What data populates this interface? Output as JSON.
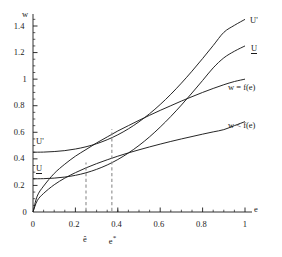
{
  "chart_data": {
    "type": "line",
    "title": "",
    "xlabel": "e",
    "ylabel": "w",
    "xlim": [
      0,
      1.06
    ],
    "ylim": [
      0,
      1.52
    ],
    "grid": false,
    "legend_position": "right-inline-labels",
    "xticks": [
      "0",
      "0.2",
      "0.4",
      "0.6",
      "0.8",
      "1"
    ],
    "xtick_values": [
      0,
      0.2,
      0.4,
      0.6,
      0.8,
      1
    ],
    "yticks": [
      "0",
      "0.2",
      "0.4",
      "0.6",
      "0.8",
      "1",
      "1.2",
      "1.4"
    ],
    "ytick_values": [
      0,
      0.2,
      0.4,
      0.6,
      0.8,
      1.0,
      1.2,
      1.4
    ],
    "minor_ticks": true,
    "series": [
      {
        "name": "U'",
        "label_right": "U'",
        "label_left": "U'",
        "description": "upper indifference curve, convex",
        "x": [
          0.0,
          0.05,
          0.1,
          0.15,
          0.2,
          0.25,
          0.3,
          0.35,
          0.4,
          0.45,
          0.5,
          0.55,
          0.6,
          0.65,
          0.7,
          0.75,
          0.8,
          0.85,
          0.9,
          0.95,
          1.0
        ],
        "values": [
          0.45,
          0.451,
          0.455,
          0.462,
          0.474,
          0.491,
          0.514,
          0.544,
          0.581,
          0.626,
          0.679,
          0.74,
          0.809,
          0.886,
          0.97,
          1.06,
          1.155,
          1.253,
          1.352,
          1.405,
          1.45
        ]
      },
      {
        "name": "U",
        "label_right": "U",
        "label_left": "U",
        "underlined": true,
        "description": "lower indifference curve, convex",
        "x": [
          0.0,
          0.05,
          0.1,
          0.15,
          0.2,
          0.25,
          0.3,
          0.35,
          0.4,
          0.45,
          0.5,
          0.55,
          0.6,
          0.65,
          0.7,
          0.75,
          0.8,
          0.85,
          0.9,
          0.95,
          1.0
        ],
        "values": [
          0.25,
          0.251,
          0.255,
          0.263,
          0.276,
          0.295,
          0.321,
          0.354,
          0.395,
          0.444,
          0.501,
          0.566,
          0.639,
          0.719,
          0.805,
          0.896,
          0.99,
          1.085,
          1.16,
          1.21,
          1.25
        ]
      },
      {
        "name": "w = f(e)",
        "label_right": "w = f(e)",
        "description": "production function, concave through origin",
        "x": [
          0.0,
          0.02,
          0.05,
          0.1,
          0.15,
          0.2,
          0.25,
          0.3,
          0.35,
          0.4,
          0.45,
          0.5,
          0.55,
          0.6,
          0.65,
          0.7,
          0.75,
          0.8,
          0.85,
          0.9,
          0.95,
          1.0
        ],
        "values": [
          0.0,
          0.12,
          0.195,
          0.29,
          0.36,
          0.42,
          0.47,
          0.52,
          0.565,
          0.61,
          0.65,
          0.69,
          0.728,
          0.765,
          0.8,
          0.835,
          0.868,
          0.9,
          0.93,
          0.958,
          0.982,
          1.0
        ]
      },
      {
        "name": "w < f(e)",
        "label_right": "w < f(e)",
        "description": "lower concave curve through origin",
        "x": [
          0.0,
          0.02,
          0.05,
          0.1,
          0.15,
          0.2,
          0.25,
          0.3,
          0.35,
          0.4,
          0.45,
          0.5,
          0.55,
          0.6,
          0.65,
          0.7,
          0.75,
          0.8,
          0.85,
          0.9,
          0.95,
          1.0
        ],
        "values": [
          0.0,
          0.085,
          0.14,
          0.205,
          0.255,
          0.296,
          0.332,
          0.364,
          0.393,
          0.42,
          0.445,
          0.468,
          0.49,
          0.511,
          0.531,
          0.55,
          0.568,
          0.586,
          0.603,
          0.62,
          0.65,
          0.68
        ]
      }
    ],
    "vertical_markers": [
      {
        "label": "ê",
        "x": 0.25,
        "y_top": 0.372,
        "style": "dashed",
        "color": "#8c8c8c"
      },
      {
        "label": "e*",
        "x": 0.372,
        "y_top": 0.625,
        "style": "dashed",
        "color": "#8c8c8c"
      }
    ],
    "annotations": {
      "e_hat": "ê",
      "e_star": "e*"
    },
    "colors": {
      "curve": "#1a1a1a",
      "axis": "#1a1a1a",
      "dashed": "#8c8c8c",
      "background": "#ffffff"
    }
  },
  "axis": {
    "y_name": "w",
    "x_name": "e"
  },
  "left_labels": {
    "u_prime": "U'",
    "u_bar": "U"
  },
  "right_labels": {
    "u_prime": "U'",
    "u_bar": "U",
    "w_eq": "w = f(e)",
    "w_lt": "w < f(e)"
  },
  "xtick_labels": [
    "0",
    "0.2",
    "0.4",
    "0.6",
    "0.8",
    "1"
  ],
  "ytick_labels": [
    "0",
    "0.2",
    "0.4",
    "0.6",
    "0.8",
    "1",
    "1.2",
    "1.4"
  ],
  "marker_labels": [
    "ê",
    "e*"
  ]
}
